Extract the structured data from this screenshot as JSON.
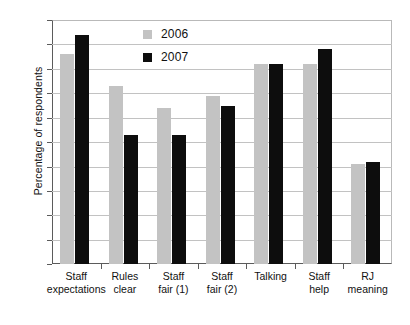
{
  "chart_data": {
    "type": "bar",
    "title": "",
    "xlabel": "",
    "ylabel": "Percentage of respondents",
    "ylim": [
      0,
      100
    ],
    "ytick_step": 10,
    "yticks": [
      100,
      90,
      80,
      70,
      60,
      50,
      40,
      30,
      20,
      10,
      0
    ],
    "grid": true,
    "legend_position": "top-center",
    "categories": [
      "Staff expectations",
      "Rules clear",
      "Staff fair (1)",
      "Staff fair (2)",
      "Talking",
      "Staff help",
      "RJ meaning"
    ],
    "category_lines": [
      [
        "Staff",
        "expectations"
      ],
      [
        "Rules",
        "clear"
      ],
      [
        "Staff",
        "fair (1)"
      ],
      [
        "Staff",
        "fair (2)"
      ],
      [
        "Talking",
        ""
      ],
      [
        "Staff",
        "help"
      ],
      [
        "RJ",
        "meaning"
      ]
    ],
    "series": [
      {
        "name": "2006",
        "color": "#c3c3c3",
        "values": [
          86,
          73,
          64,
          69,
          82,
          82,
          41
        ]
      },
      {
        "name": "2007",
        "color": "#0d0d0d",
        "values": [
          94,
          53,
          53,
          65,
          82,
          88,
          42
        ]
      }
    ]
  },
  "legend": {
    "items": [
      {
        "label": "2006",
        "color": "#c3c3c3"
      },
      {
        "label": "2007",
        "color": "#0d0d0d"
      }
    ]
  }
}
